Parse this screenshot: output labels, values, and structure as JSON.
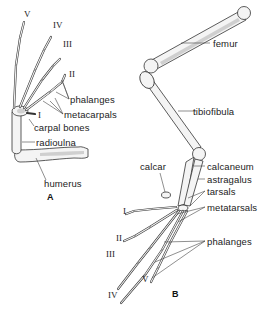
{
  "figure": {
    "panel_a": {
      "label": "A",
      "digits": [
        "V",
        "IV",
        "III",
        "II",
        "I"
      ],
      "labels": {
        "phalanges": "phalanges",
        "metacarpals": "metacarpals",
        "carpal_bones": "carpal bones",
        "radioulna": "radioulna",
        "humerus": "humerus"
      }
    },
    "panel_b": {
      "label": "B",
      "digits": [
        "I",
        "II",
        "III",
        "IV",
        "V"
      ],
      "labels": {
        "femur": "femur",
        "tibiofibula": "tibiofibula",
        "calcar": "calcar",
        "calcaneum": "calcaneum",
        "astragalus": "astragalus",
        "tarsals": "tarsals",
        "metatarsals": "metatarsals",
        "phalanges": "phalanges"
      }
    }
  }
}
